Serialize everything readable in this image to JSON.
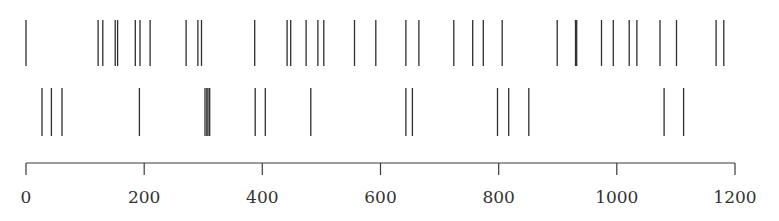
{
  "chart_data": {
    "type": "raster",
    "title": "",
    "xlabel": "",
    "ylabel": "",
    "xlim": [
      0,
      1200
    ],
    "grid": false,
    "legend": null,
    "x_ticks": [
      0,
      200,
      400,
      600,
      800,
      1000,
      1200
    ],
    "x_tick_labels": [
      "0",
      "200",
      "400",
      "600",
      "800",
      "1000",
      "1200"
    ],
    "series": [
      {
        "name": "row-1",
        "events": [
          0,
          122,
          130,
          151,
          155,
          185,
          193,
          210,
          271,
          291,
          297,
          387,
          442,
          448,
          474,
          494,
          504,
          556,
          592,
          643,
          665,
          724,
          756,
          774,
          806,
          899,
          930,
          932,
          974,
          994,
          1021,
          1034,
          1073,
          1101,
          1168,
          1181
        ]
      },
      {
        "name": "row-2",
        "events": [
          27,
          43,
          61,
          192,
          303,
          306,
          308,
          311,
          388,
          405,
          482,
          643,
          654,
          798,
          817,
          851,
          1080,
          1113
        ]
      }
    ]
  },
  "layout": {
    "x0_px": 26,
    "x1_px": 735,
    "rows": [
      {
        "y_top": 20,
        "y_bottom": 66
      },
      {
        "y_top": 88,
        "y_bottom": 136
      }
    ],
    "axis_y": 163,
    "tick_len": 12,
    "label_y": 203
  }
}
